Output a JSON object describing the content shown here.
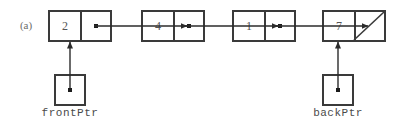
{
  "figure": {
    "label": "(a)",
    "kind": "linked-list-diagram",
    "colors": {
      "background": "#ffffff",
      "stroke": "#3a3a3a",
      "arrow": "#2b2b2b",
      "value_text": "#555555",
      "label_text": "#4a4a4a"
    }
  },
  "nodes": [
    {
      "value": "2",
      "link": "pointer",
      "x": 48
    },
    {
      "value": "4",
      "link": "pointer",
      "x": 141
    },
    {
      "value": "1",
      "link": "pointer",
      "x": 232
    },
    {
      "value": "7",
      "link": "null-slash",
      "x": 322
    }
  ],
  "pointers": [
    {
      "name": "frontPtr",
      "label": "frontPtr",
      "target_node_index": 0
    },
    {
      "name": "backPtr",
      "label": "backPtr",
      "target_node_index": 3
    }
  ]
}
